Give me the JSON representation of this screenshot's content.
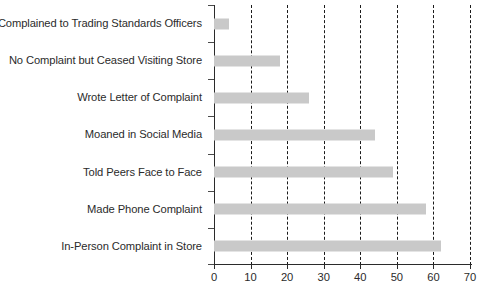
{
  "chart_data": {
    "type": "bar",
    "orientation": "horizontal",
    "title": "",
    "subtitle": "",
    "xlabel": "",
    "ylabel": "",
    "categories": [
      "Complained to Trading Standards Officers",
      "No Complaint but Ceased Visiting Store",
      "Wrote Letter of Complaint",
      "Moaned in Social Media",
      "Told Peers Face to Face",
      "Made Phone Complaint",
      "In-Person Complaint in Store"
    ],
    "values": [
      4,
      18,
      26,
      44,
      49,
      58,
      62
    ],
    "xlim": [
      0,
      70
    ],
    "xticks": [
      0,
      10,
      20,
      30,
      40,
      50,
      60,
      70
    ],
    "xtick_labels": [
      "0",
      "10",
      "20",
      "30",
      "40",
      "50",
      "60",
      "70"
    ],
    "grid": true,
    "grid_axis": "x",
    "grid_style": "dashed",
    "legend": false,
    "legend_position": "none",
    "bar_color": "#c9c9c9",
    "axis_color": "#2b2b2b",
    "grid_color": "#1a1a1a",
    "text_color": "#2b2b2b"
  }
}
